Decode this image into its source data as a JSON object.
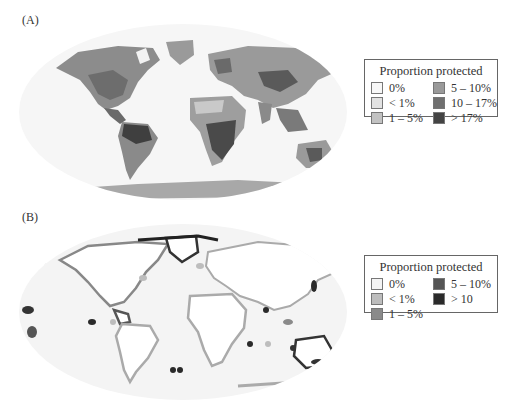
{
  "figure": {
    "panels": [
      {
        "label": "(A)",
        "subject": "terrestrial",
        "legend": {
          "title": "Proportion protected",
          "items": [
            {
              "label": "0%",
              "color": "#f7f7f7"
            },
            {
              "label": "< 1%",
              "color": "#e2e2e2"
            },
            {
              "label": "1 – 5%",
              "color": "#c2c2c2"
            },
            {
              "label": "5 – 10%",
              "color": "#9a9a9a"
            },
            {
              "label": "10 – 17%",
              "color": "#707070"
            },
            {
              "label": "> 17%",
              "color": "#444444"
            }
          ]
        }
      },
      {
        "label": "(B)",
        "subject": "marine",
        "legend": {
          "title": "Proportion protected",
          "items": [
            {
              "label": "0%",
              "color": "#f4f4f4"
            },
            {
              "label": "< 1%",
              "color": "#bdbdbd"
            },
            {
              "label": "1 – 5%",
              "color": "#8a8a8a"
            },
            {
              "label": "5 – 10%",
              "color": "#555555"
            },
            {
              "label": "> 10",
              "color": "#2a2a2a"
            }
          ]
        }
      }
    ]
  }
}
